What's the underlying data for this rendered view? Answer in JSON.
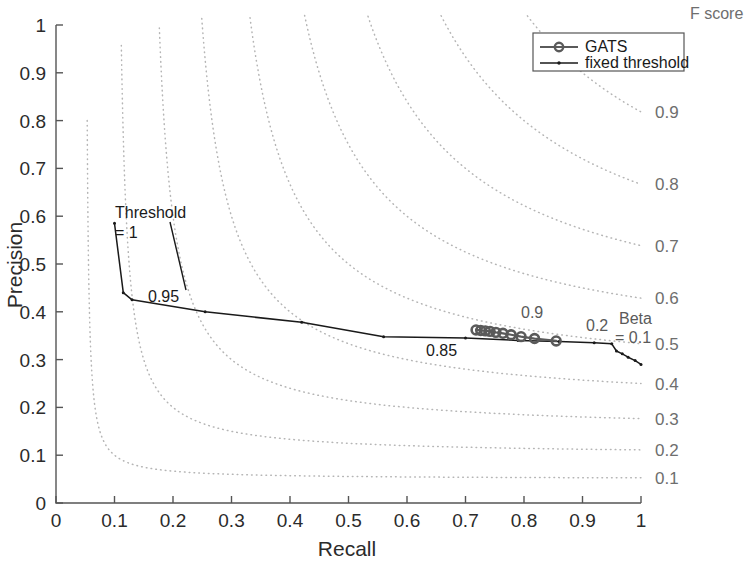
{
  "chart_data": {
    "type": "line",
    "title": "",
    "xlabel": "Recall",
    "ylabel": "Precision",
    "xlim": [
      0,
      1
    ],
    "ylim": [
      0,
      1
    ],
    "xticks": [
      "0",
      "0.1",
      "0.2",
      "0.3",
      "0.4",
      "0.5",
      "0.6",
      "0.7",
      "0.8",
      "0.9",
      "1"
    ],
    "yticks": [
      "0",
      "0.1",
      "0.2",
      "0.3",
      "0.4",
      "0.5",
      "0.6",
      "0.7",
      "0.8",
      "0.9",
      "1"
    ],
    "xtick_values": [
      0,
      0.1,
      0.2,
      0.3,
      0.4,
      0.5,
      0.6,
      0.7,
      0.8,
      0.9,
      1
    ],
    "ytick_values": [
      0,
      0.1,
      0.2,
      0.3,
      0.4,
      0.5,
      0.6,
      0.7,
      0.8,
      0.9,
      1
    ],
    "grid": false,
    "legend_position": "top-right",
    "legend": [
      {
        "name": "GATS",
        "marker": "circle",
        "line": "solid",
        "color": "#5a5a5a"
      },
      {
        "name": "fixed threshold",
        "marker": "dot",
        "line": "solid",
        "color": "#1a1a1a"
      }
    ],
    "right_axis": {
      "title": "F score",
      "labels": [
        "0.9",
        "0.8",
        "0.7",
        "0.6",
        "0.5",
        "0.4",
        "0.3",
        "0.2",
        "0.1"
      ],
      "values": [
        0.9,
        0.8,
        0.7,
        0.6,
        0.5,
        0.4,
        0.3,
        0.2,
        0.1
      ],
      "style": "dotted-isoline"
    },
    "isolines": {
      "formula": "F = 2*P*R/(P+R)",
      "levels": [
        0.1,
        0.2,
        0.3,
        0.4,
        0.5,
        0.6,
        0.7,
        0.8,
        0.9
      ],
      "color": "#b5b5b5",
      "style": "dotted"
    },
    "series": [
      {
        "name": "fixed threshold",
        "marker": "dot",
        "color": "#1a1a1a",
        "points": [
          [
            0.1,
            0.585
          ],
          [
            0.115,
            0.44
          ],
          [
            0.13,
            0.425
          ],
          [
            0.255,
            0.4
          ],
          [
            0.42,
            0.378
          ],
          [
            0.56,
            0.348
          ],
          [
            0.7,
            0.345
          ],
          [
            0.79,
            0.34
          ],
          [
            0.86,
            0.338
          ],
          [
            0.92,
            0.335
          ],
          [
            0.95,
            0.333
          ],
          [
            0.958,
            0.318
          ],
          [
            0.968,
            0.312
          ],
          [
            0.978,
            0.305
          ],
          [
            0.99,
            0.298
          ],
          [
            1.0,
            0.29
          ]
        ]
      },
      {
        "name": "GATS",
        "marker": "circle",
        "color": "#5a5a5a",
        "points": [
          [
            0.718,
            0.362
          ],
          [
            0.726,
            0.361
          ],
          [
            0.734,
            0.36
          ],
          [
            0.742,
            0.359
          ],
          [
            0.752,
            0.357
          ],
          [
            0.764,
            0.355
          ],
          [
            0.778,
            0.352
          ],
          [
            0.795,
            0.348
          ],
          [
            0.818,
            0.344
          ],
          [
            0.855,
            0.339
          ]
        ]
      }
    ],
    "annotations": [
      {
        "text": "Threshold",
        "x_px": 115,
        "y_px": 218,
        "color": "#1a1a1a"
      },
      {
        "text": "= 1",
        "x_px": 115,
        "y_px": 238,
        "color": "#1a1a1a"
      },
      {
        "text": "0.95",
        "x_px": 148,
        "y_px": 302,
        "color": "#1a1a1a"
      },
      {
        "text": "0.85",
        "x_px": 426,
        "y_px": 356,
        "color": "#1a1a1a"
      },
      {
        "text": "0.9",
        "x_px": 521,
        "y_px": 318,
        "color": "#5a5a5a"
      },
      {
        "text": "0.2",
        "x_px": 586,
        "y_px": 331,
        "color": "#5a5a5a"
      },
      {
        "text": "Beta",
        "x_px": 619,
        "y_px": 324,
        "color": "#5a5a5a"
      },
      {
        "text": "= 0.1",
        "x_px": 615,
        "y_px": 343,
        "color": "#5a5a5a"
      }
    ]
  }
}
